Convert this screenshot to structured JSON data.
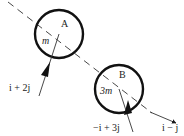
{
  "diagram": {
    "title": "",
    "colors": {
      "stroke": "#1a1a1a",
      "text": "#222222",
      "background": "#ffffff"
    },
    "line_of_centres": {
      "style": "dashed",
      "from": [
        8,
        0
      ],
      "to": [
        150,
        112
      ]
    },
    "bodies": [
      {
        "id": "A",
        "label": "A",
        "mass_label": "m",
        "center": [
          59,
          34
        ],
        "radius": 24
      },
      {
        "id": "B",
        "label": "B",
        "mass_label": "3m",
        "center": [
          119,
          89
        ],
        "radius": 24
      }
    ],
    "vectors": [
      {
        "id": "velocity-a",
        "label": "i + 2j",
        "from": [
          59,
          34
        ],
        "tip": [
          49,
          63
        ],
        "tail": [
          39,
          96
        ]
      },
      {
        "id": "velocity-b",
        "label": "−i + 3j",
        "from": [
          119,
          89
        ],
        "tip": [
          127,
          99
        ],
        "tail": [
          133,
          133
        ]
      },
      {
        "id": "direction",
        "label": "i − j",
        "from": [
          150,
          112
        ],
        "tip": [
          176,
          122
        ]
      }
    ]
  }
}
